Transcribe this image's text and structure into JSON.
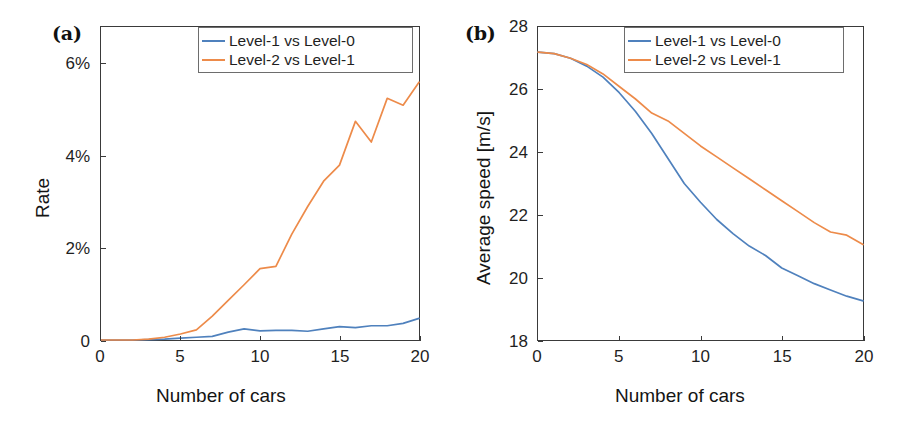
{
  "figure": {
    "background": "#ffffff",
    "width": 904,
    "height": 424
  },
  "colors": {
    "series_1": "#4F81BD",
    "series_2": "#ED8B4A",
    "axis": "#3a3a3a",
    "text": "#1f1f1f",
    "legend_border": "#6d6d6d"
  },
  "panels": {
    "a": {
      "tag": "(a)",
      "legend": {
        "position": "top-right",
        "entries": [
          "Level-1 vs Level-0",
          "Level-2 vs Level-1"
        ]
      }
    },
    "b": {
      "tag": "(b)",
      "legend": {
        "position": "top-right",
        "entries": [
          "Level-1 vs Level-0",
          "Level-2 vs Level-1"
        ]
      }
    }
  },
  "chart_data": [
    {
      "panel": "a",
      "type": "line",
      "title": "",
      "xlabel": "Number of cars",
      "ylabel": "Rate",
      "xlim": [
        0,
        20
      ],
      "ylim": [
        0,
        6.8
      ],
      "xticks": [
        0,
        5,
        10,
        15,
        20
      ],
      "xticklabels": [
        "0",
        "5",
        "10",
        "15",
        "20"
      ],
      "yticks": [
        0,
        2,
        4,
        6
      ],
      "yticklabels": [
        "0",
        "2%",
        "4%",
        "6%"
      ],
      "grid": false,
      "legend_position": "top-right",
      "x": [
        0,
        1,
        2,
        3,
        4,
        5,
        6,
        7,
        8,
        9,
        10,
        11,
        12,
        13,
        14,
        15,
        16,
        17,
        18,
        19,
        20
      ],
      "series": [
        {
          "name": "Level-1 vs Level-0",
          "color": "#4F81BD",
          "values": [
            0.0,
            0.0,
            0.0,
            0.01,
            0.02,
            0.04,
            0.06,
            0.08,
            0.17,
            0.24,
            0.2,
            0.21,
            0.21,
            0.19,
            0.24,
            0.29,
            0.27,
            0.31,
            0.31,
            0.36,
            0.47,
            0.5
          ]
        },
        {
          "name": "Level-2 vs Level-1",
          "color": "#ED8B4A",
          "values": [
            0.0,
            0.0,
            0.0,
            0.02,
            0.06,
            0.13,
            0.22,
            0.52,
            0.86,
            1.2,
            1.55,
            1.6,
            2.3,
            2.9,
            3.45,
            3.8,
            4.75,
            4.3,
            5.25,
            5.1,
            5.6
          ]
        }
      ]
    },
    {
      "panel": "b",
      "type": "line",
      "title": "",
      "xlabel": "Number of cars",
      "ylabel": "Average speed [m/s]",
      "xlim": [
        0,
        20
      ],
      "ylim": [
        18,
        28
      ],
      "xticks": [
        0,
        5,
        10,
        15,
        20
      ],
      "xticklabels": [
        "0",
        "5",
        "10",
        "15",
        "20"
      ],
      "yticks": [
        18,
        20,
        22,
        24,
        26,
        28
      ],
      "yticklabels": [
        "18",
        "20",
        "22",
        "24",
        "26",
        "28"
      ],
      "grid": false,
      "legend_position": "top-right",
      "x": [
        0,
        1,
        2,
        3,
        4,
        5,
        6,
        7,
        8,
        9,
        10,
        11,
        12,
        13,
        14,
        15,
        16,
        17,
        18,
        19,
        20
      ],
      "series": [
        {
          "name": "Level-1 vs Level-0",
          "color": "#4F81BD",
          "values": [
            27.2,
            27.15,
            27.0,
            26.75,
            26.4,
            25.9,
            25.3,
            24.6,
            23.8,
            23.0,
            22.4,
            21.85,
            21.4,
            21.0,
            20.7,
            20.3,
            20.05,
            19.8,
            19.6,
            19.4,
            19.25
          ]
        },
        {
          "name": "Level-2 vs Level-1",
          "color": "#ED8B4A",
          "values": [
            27.2,
            27.15,
            27.0,
            26.8,
            26.5,
            26.1,
            25.7,
            25.25,
            25.0,
            24.6,
            24.2,
            23.85,
            23.5,
            23.15,
            22.8,
            22.45,
            22.1,
            21.75,
            21.45,
            21.35,
            21.05
          ]
        }
      ]
    }
  ]
}
